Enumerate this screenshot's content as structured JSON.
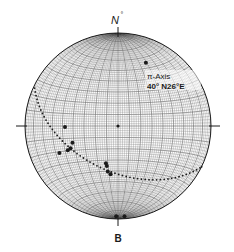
{
  "diagram": {
    "type": "stereonet",
    "north_label": "N",
    "north_degree_mark": "°",
    "bottom_label": "B",
    "axis_label_line1": "π-Axis",
    "axis_label_line2": "40° N26°E",
    "colors": {
      "ink": "#1a1a1a",
      "grid": "#555555",
      "background": "#ffffff"
    }
  },
  "chart_data": {
    "type": "scatter",
    "title": "",
    "projection": "equal-area lower hemisphere",
    "great_circle": {
      "description": "dotted girdle arc",
      "pole_trend_deg": 26,
      "pole_plunge_deg": 40
    },
    "pi_axis": {
      "plunge_deg": 40,
      "trend": "N26°E"
    },
    "points": [
      {
        "name": "pi-axis",
        "x": 0.3,
        "y": 0.68
      },
      {
        "name": "center",
        "x": 0.0,
        "y": 0.0
      },
      {
        "name": "p1",
        "x": -0.57,
        "y": -0.01
      },
      {
        "name": "p2",
        "x": -0.49,
        "y": -0.18
      },
      {
        "name": "p3",
        "x": -0.51,
        "y": -0.24
      },
      {
        "name": "p4",
        "x": -0.54,
        "y": -0.26
      },
      {
        "name": "p5",
        "x": -0.63,
        "y": -0.29
      },
      {
        "name": "p6",
        "x": -0.13,
        "y": -0.4
      },
      {
        "name": "p7",
        "x": -0.12,
        "y": -0.43
      },
      {
        "name": "p8",
        "x": -0.11,
        "y": -0.49
      },
      {
        "name": "p9",
        "x": -0.08,
        "y": -0.52
      },
      {
        "name": "p10",
        "x": -0.02,
        "y": -0.97
      },
      {
        "name": "p11",
        "x": 0.07,
        "y": -0.97
      }
    ]
  }
}
